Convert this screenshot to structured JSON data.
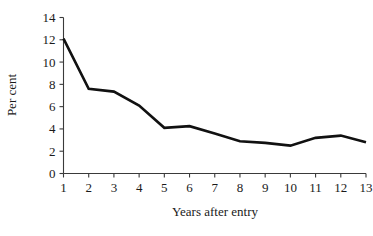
{
  "chart_data": {
    "type": "line",
    "title": "",
    "xlabel": "Years after entry",
    "ylabel": "Per cent",
    "x": [
      1,
      2,
      3,
      4,
      5,
      6,
      7,
      8,
      9,
      10,
      11,
      12,
      13
    ],
    "xticklabels": [
      "1",
      "2",
      "3",
      "4",
      "5",
      "6",
      "7",
      "8",
      "9",
      "10",
      "11",
      "12",
      "13"
    ],
    "yticks": [
      0,
      2,
      4,
      6,
      8,
      10,
      12,
      14
    ],
    "yticklabels": [
      "0",
      "2",
      "4",
      "6",
      "8",
      "10",
      "12",
      "14"
    ],
    "xlim": [
      1,
      13
    ],
    "ylim": [
      0,
      14
    ],
    "grid": false,
    "legend": null,
    "series": [
      {
        "name": "Per cent",
        "color": "#111111",
        "values": [
          12.1,
          7.6,
          7.35,
          6.1,
          4.1,
          4.25,
          3.6,
          2.9,
          2.75,
          2.5,
          3.2,
          3.4,
          2.8
        ]
      }
    ]
  }
}
